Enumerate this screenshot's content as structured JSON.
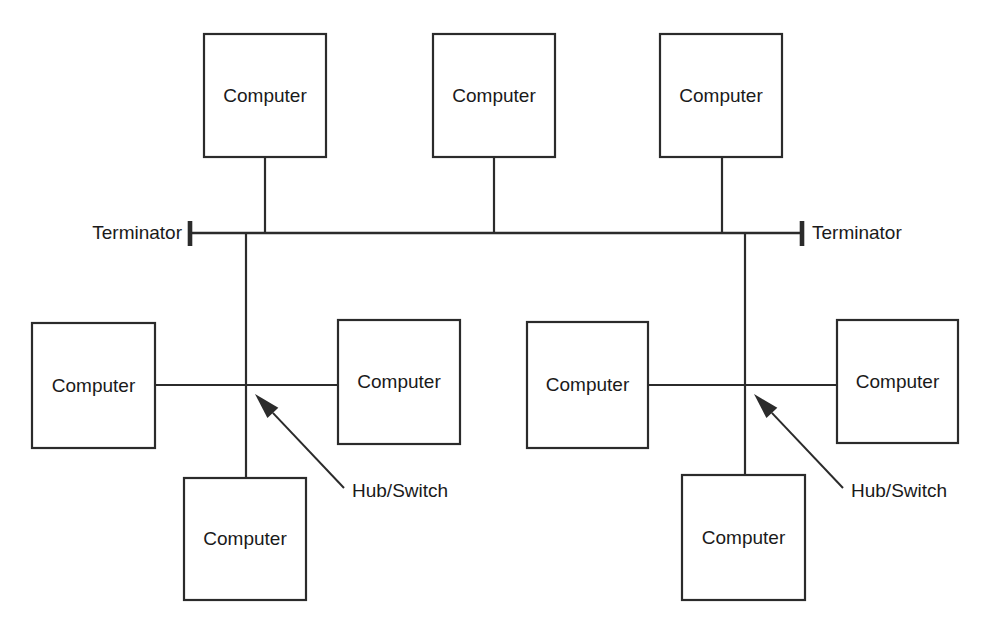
{
  "diagram": {
    "colors": {
      "stroke": "#2b2b2b",
      "background": "#ffffff",
      "text": "#1a1a1a"
    },
    "nodes": [
      {
        "id": "top-left",
        "label": "Computer",
        "x": 204,
        "y": 34,
        "w": 122,
        "h": 123
      },
      {
        "id": "top-center",
        "label": "Computer",
        "x": 433,
        "y": 34,
        "w": 122,
        "h": 123
      },
      {
        "id": "top-right",
        "label": "Computer",
        "x": 660,
        "y": 34,
        "w": 122,
        "h": 123
      },
      {
        "id": "mid-far-left",
        "label": "Computer",
        "x": 32,
        "y": 323,
        "w": 123,
        "h": 125
      },
      {
        "id": "mid-left-right",
        "label": "Computer",
        "x": 338,
        "y": 320,
        "w": 122,
        "h": 124
      },
      {
        "id": "mid-right-left",
        "label": "Computer",
        "x": 527,
        "y": 322,
        "w": 121,
        "h": 126
      },
      {
        "id": "mid-far-right",
        "label": "Computer",
        "x": 837,
        "y": 320,
        "w": 121,
        "h": 123
      },
      {
        "id": "bottom-left",
        "label": "Computer",
        "x": 184,
        "y": 478,
        "w": 122,
        "h": 122
      },
      {
        "id": "bottom-right",
        "label": "Computer",
        "x": 682,
        "y": 475,
        "w": 123,
        "h": 125
      }
    ],
    "backbone": {
      "y": 233,
      "x_start": 192,
      "x_end": 801
    },
    "terminators": [
      {
        "id": "terminator-left",
        "label": "Terminator",
        "bar_x": 190,
        "bar_y_top": 221,
        "bar_y_bottom": 246,
        "label_x": 182,
        "label_y": 233,
        "align": "end"
      },
      {
        "id": "terminator-right",
        "label": "Terminator",
        "bar_x": 802,
        "bar_y_top": 221,
        "bar_y_bottom": 246,
        "label_x": 812,
        "label_y": 233,
        "align": "start"
      }
    ],
    "hubs": [
      {
        "id": "hub-left",
        "label": "Hub/Switch",
        "junction_x": 246,
        "junction_y": 385,
        "arrow_tip_x": 255,
        "arrow_tip_y": 394,
        "leader_tail_x": 344,
        "leader_tail_y": 488,
        "label_x": 352,
        "label_y": 491,
        "segment_left_x": 155,
        "segment_right_x": 338,
        "drop_top_y": 233,
        "drop_bottom_y": 478
      },
      {
        "id": "hub-right",
        "label": "Hub/Switch",
        "junction_x": 745,
        "junction_y": 385,
        "arrow_tip_x": 754,
        "arrow_tip_y": 394,
        "leader_tail_x": 843,
        "leader_tail_y": 488,
        "label_x": 851,
        "label_y": 491,
        "segment_left_x": 648,
        "segment_right_x": 837,
        "drop_top_y": 233,
        "drop_bottom_y": 475
      }
    ],
    "drops": [
      {
        "id": "drop-top-left",
        "x": 265,
        "y_top": 157,
        "y_bottom": 233
      },
      {
        "id": "drop-top-center",
        "x": 494,
        "y_top": 157,
        "y_bottom": 233
      },
      {
        "id": "drop-top-right",
        "x": 722,
        "y_top": 157,
        "y_bottom": 233
      }
    ]
  }
}
